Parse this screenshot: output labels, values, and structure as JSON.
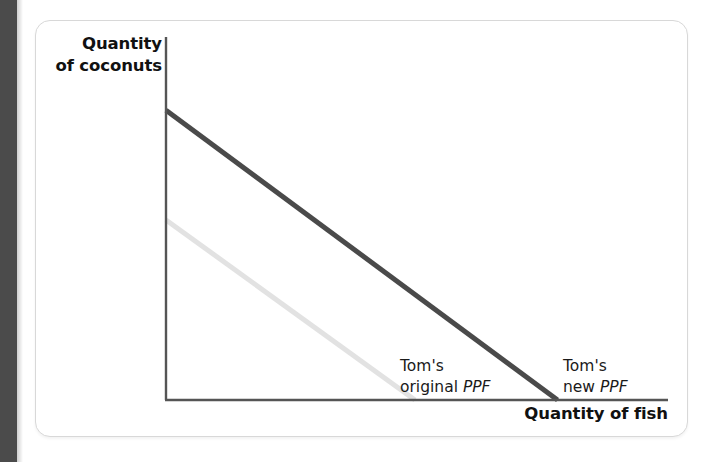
{
  "figure": {
    "background_color": "#ffffff",
    "card_border_color": "#d8d8d8",
    "edge_bar_color": "#4b4b4b"
  },
  "chart_data": {
    "type": "line",
    "title": "",
    "xlabel": "Quantity of fish",
    "ylabel": "Quantity of coconuts",
    "grid": false,
    "legend_position": "inline-annotations",
    "axis_color": "#555555",
    "xlim": [
      0,
      100
    ],
    "ylim": [
      0,
      100
    ],
    "series": [
      {
        "name": "Tom's original PPF",
        "color": "#e2e2e2",
        "label_line1": "Tom's",
        "label_line2_prefix": "original ",
        "label_line2_italic": "PPF",
        "x": [
          0,
          49.6
        ],
        "y": [
          49.6,
          0
        ],
        "x_intercept": 49.6,
        "y_intercept": 49.6
      },
      {
        "name": "Tom's new PPF",
        "color": "#4a4a4a",
        "label_line1": "Tom's",
        "label_line2_prefix": "new ",
        "label_line2_italic": "PPF",
        "x": [
          0,
          78.0
        ],
        "y": [
          79.8,
          0
        ],
        "x_intercept": 78.0,
        "y_intercept": 79.8
      }
    ],
    "annotations": [
      {
        "text": "Tom's original PPF",
        "x": 49.6,
        "y": 12
      },
      {
        "text": "Tom's new PPF",
        "x": 79.0,
        "y": 12
      }
    ]
  },
  "labels": {
    "y_axis_line1": "Quantity",
    "y_axis_line2": "of coconuts",
    "x_axis": "Quantity of fish"
  }
}
